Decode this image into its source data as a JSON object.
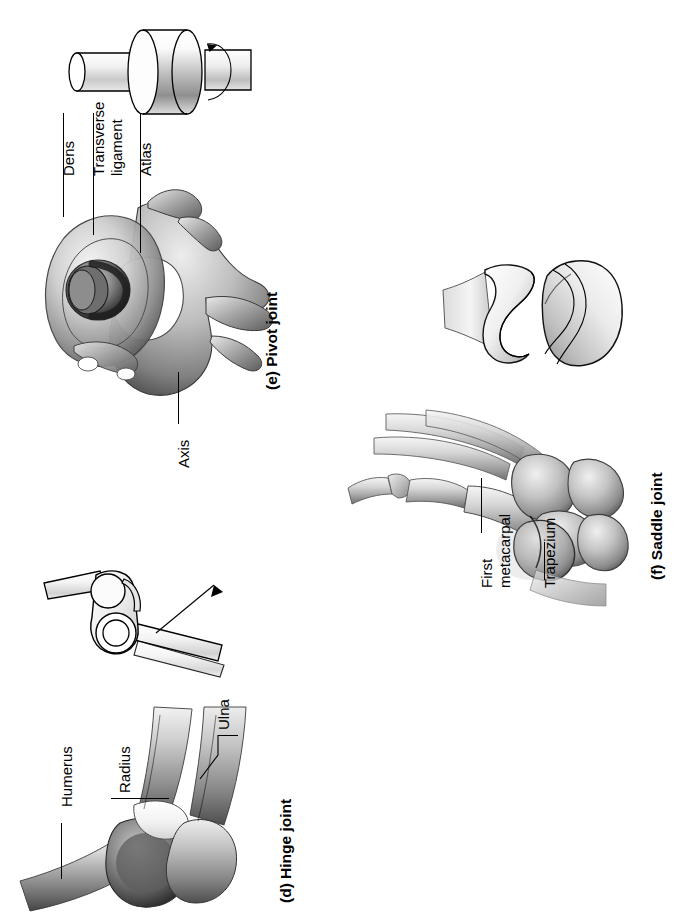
{
  "figure": {
    "orientation": "rotated-90-ccw",
    "background": "#ffffff",
    "ink": "#000000"
  },
  "panels": [
    {
      "key": "hinge",
      "caption_letter": "(d)",
      "caption_text": "Hinge joint",
      "caption_full": "(d) Hinge joint",
      "schematic": "hinge-model-with-motion-arrow",
      "specimen": "elbow-joint-bones",
      "labels": [
        {
          "id": "humerus",
          "text": "Humerus"
        },
        {
          "id": "radius",
          "text": "Radius"
        },
        {
          "id": "ulna",
          "text": "Ulna"
        }
      ]
    },
    {
      "key": "pivot",
      "caption_letter": "(e)",
      "caption_text": "Pivot joint",
      "caption_full": "(e) Pivot joint",
      "schematic": "pivot-model-cylinder-with-rotation-arrow",
      "specimen": "atlas-axis-vertebrae-superior-view",
      "labels": [
        {
          "id": "dens",
          "text": "Dens"
        },
        {
          "id": "transverse-ligament",
          "text": "Transverse",
          "text2": "ligament",
          "text_full": "Transverse ligament"
        },
        {
          "id": "atlas",
          "text": "Atlas"
        },
        {
          "id": "axis",
          "text": "Axis"
        }
      ]
    },
    {
      "key": "saddle",
      "caption_letter": "(f)",
      "caption_text": "Saddle joint",
      "caption_full": "(f) Saddle joint",
      "schematic": "saddle-model-two-reciprocal-surfaces",
      "specimen": "hand-wrist-carpometacarpal-joint",
      "labels": [
        {
          "id": "first-metacarpal",
          "text": "First",
          "text2": "metacarpal",
          "text_full": "First metacarpal"
        },
        {
          "id": "trapezium",
          "text": "Trapezium"
        }
      ]
    }
  ]
}
